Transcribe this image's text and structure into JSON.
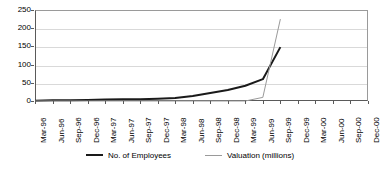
{
  "chart_data": {
    "type": "line",
    "title": "",
    "subtitle": "",
    "xlabel": "",
    "ylabel": "",
    "ylim": [
      0,
      250
    ],
    "ytick_step": 50,
    "ytick_labels": [
      "250",
      "200",
      "150",
      "100",
      "50",
      "0"
    ],
    "ytick_values": [
      250,
      200,
      150,
      100,
      50,
      0
    ],
    "grid": true,
    "grid_axis": "y",
    "legend_position": "bottom",
    "categories": [
      "Mar-96",
      "Jun-96",
      "Sep-96",
      "Dec-96",
      "Mar-97",
      "Jun-97",
      "Sep-97",
      "Dec-97",
      "Mar-98",
      "Jun-98",
      "Sep-98",
      "Dec-98",
      "Mar-99",
      "Jun-99",
      "Sep-99",
      "Dec-99",
      "Mar-00",
      "Jun-00",
      "Sep-00",
      "Dec-00"
    ],
    "series": [
      {
        "name": "No. of Employees",
        "color": "#1a1a1a",
        "width": 2,
        "values": [
          1,
          2,
          2,
          3,
          4,
          5,
          5,
          6,
          8,
          14,
          22,
          30,
          42,
          60,
          148,
          null,
          null,
          null,
          null,
          null
        ]
      },
      {
        "name": "Valuation (millions)",
        "color": "#9a9a9a",
        "width": 1,
        "values": [
          0,
          0,
          0,
          0,
          0,
          0,
          0,
          0,
          0,
          0,
          0,
          0,
          0,
          10,
          225,
          null,
          null,
          null,
          null,
          null
        ]
      }
    ]
  },
  "legend": {
    "items": [
      {
        "label": "No. of Employees",
        "swatch": "thick-line-swatch"
      },
      {
        "label": "Valuation (millions)",
        "swatch": "thin-line-swatch"
      }
    ]
  }
}
